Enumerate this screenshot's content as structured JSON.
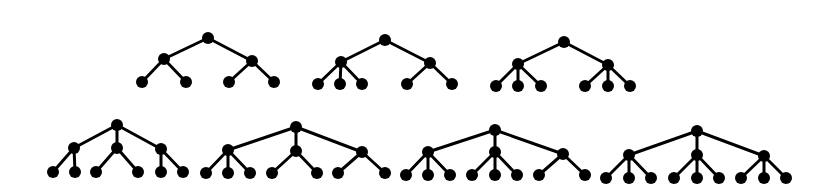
{
  "diagram": {
    "style": {
      "node_color": "#000000",
      "edge_color": "#000000",
      "node_radius": 6,
      "edge_width": 3
    },
    "trees": [
      {
        "id": "tree-1",
        "root": [
          208,
          38
        ],
        "children": [
          {
            "pos": [
              164,
              59
            ],
            "leaves": [
              [
                142,
                82
              ],
              [
                186,
                82
              ]
            ]
          },
          {
            "pos": [
              252,
              61
            ],
            "leaves": [
              [
                229,
                82
              ],
              [
                274,
                82
              ]
            ]
          }
        ]
      },
      {
        "id": "tree-2",
        "root": [
          385,
          40
        ],
        "children": [
          {
            "pos": [
              341,
              62
            ],
            "leaves": [
              [
                318,
                84
              ],
              [
                340,
                84
              ],
              [
                362,
                84
              ]
            ]
          },
          {
            "pos": [
              430,
              63
            ],
            "leaves": [
              [
                407,
                84
              ],
              [
                452,
                84
              ]
            ]
          }
        ]
      },
      {
        "id": "tree-3",
        "root": [
          564,
          42
        ],
        "children": [
          {
            "pos": [
              518,
              64
            ],
            "leaves": [
              [
                496,
                86
              ],
              [
                518,
                86
              ],
              [
                541,
                86
              ]
            ]
          },
          {
            "pos": [
              608,
              65
            ],
            "leaves": [
              [
                585,
                86
              ],
              [
                608,
                86
              ],
              [
                630,
                86
              ]
            ]
          }
        ]
      },
      {
        "id": "tree-4",
        "root": [
          117,
          125
        ],
        "children": [
          {
            "pos": [
              74,
              148
            ],
            "leaves": [
              [
                53,
                172
              ],
              [
                75,
                172
              ]
            ]
          },
          {
            "pos": [
              117,
              148
            ],
            "leaves": [
              [
                96,
                172
              ],
              [
                138,
                172
              ]
            ]
          },
          {
            "pos": [
              161,
              149
            ],
            "leaves": [
              [
                161,
                172
              ],
              [
                183,
                172
              ]
            ]
          }
        ]
      },
      {
        "id": "tree-5",
        "root": [
          296,
          127
        ],
        "children": [
          {
            "pos": [
              228,
              150
            ],
            "leaves": [
              [
                206,
                173
              ],
              [
                228,
                173
              ],
              [
                250,
                173
              ]
            ]
          },
          {
            "pos": [
              296,
              151
            ],
            "leaves": [
              [
                272,
                173
              ],
              [
                317,
                173
              ]
            ]
          },
          {
            "pos": [
              362,
              152
            ],
            "leaves": [
              [
                338,
                173
              ],
              [
                385,
                173
              ]
            ]
          }
        ]
      },
      {
        "id": "tree-6",
        "root": [
          495,
          130
        ],
        "children": [
          {
            "pos": [
              428,
              152
            ],
            "leaves": [
              [
                406,
                175
              ],
              [
                428,
                175
              ],
              [
                450,
                175
              ]
            ]
          },
          {
            "pos": [
              495,
              152
            ],
            "leaves": [
              [
                472,
                175
              ],
              [
                495,
                175
              ],
              [
                517,
                175
              ]
            ]
          },
          {
            "pos": [
              563,
              154
            ],
            "leaves": [
              [
                539,
                175
              ],
              [
                585,
                175
              ]
            ]
          }
        ]
      },
      {
        "id": "tree-7",
        "root": [
          697,
          131
        ],
        "children": [
          {
            "pos": [
              629,
              155
            ],
            "leaves": [
              [
                606,
                178
              ],
              [
                629,
                178
              ],
              [
                651,
                178
              ]
            ]
          },
          {
            "pos": [
              697,
              155
            ],
            "leaves": [
              [
                674,
                178
              ],
              [
                697,
                178
              ],
              [
                719,
                178
              ]
            ]
          },
          {
            "pos": [
              764,
              156
            ],
            "leaves": [
              [
                741,
                178
              ],
              [
                764,
                178
              ],
              [
                786,
                178
              ]
            ]
          }
        ]
      }
    ]
  }
}
